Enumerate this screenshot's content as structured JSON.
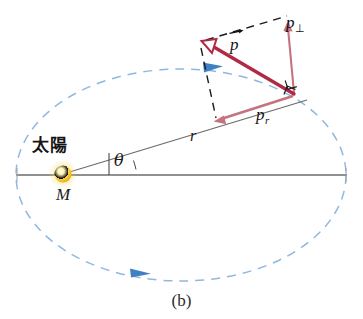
{
  "figure": {
    "caption": "(b)",
    "type": "physics-orbital-momentum-diagram"
  },
  "labels": {
    "sun_cjk": "太陽",
    "central_mass": "M",
    "angle": "θ",
    "radius": "r",
    "momentum_vector": "p",
    "momentum_perp_base": "p",
    "momentum_perp_sub": "⊥",
    "momentum_radial_base": "p",
    "momentum_radial_sub": "r"
  },
  "colors": {
    "orbit_dashed": "#8fb8e0",
    "orbit_arrow": "#3f7fc4",
    "axis_line": "#6b6b6b",
    "radius_line": "#6b6b6b",
    "momentum_vector": "#b02a45",
    "component_vector": "#c4737f",
    "construction_dashed": "#1a1a1a",
    "sun_core": "#fff6c4",
    "sun_mid": "#f5c518",
    "sun_edge": "#e0a800",
    "text": "#1a1a1a",
    "background": "#ffffff"
  },
  "geometry": {
    "canvas": {
      "width": 363,
      "height": 319
    },
    "ellipse": {
      "cx": 181,
      "cy": 175,
      "rx": 165,
      "ry": 106
    },
    "sun": {
      "cx": 63,
      "cy": 174,
      "r": 9
    },
    "planet": {
      "x": 295,
      "y": 95
    },
    "momentum_tip": {
      "x": 203,
      "y": 45
    },
    "perp_tip": {
      "x": 288,
      "y": 22
    },
    "radial_tip": {
      "x": 214,
      "y": 122
    },
    "axis_y": 175,
    "axis_x_start": 16,
    "axis_x_end": 347,
    "angle_theta_degrees": 17
  }
}
